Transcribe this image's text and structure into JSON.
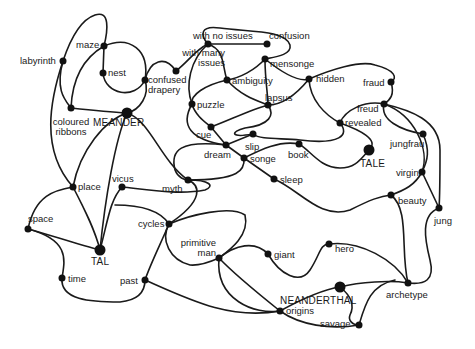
{
  "diagram": {
    "title": "",
    "nodes": [
      {
        "id": "labyrinth",
        "label": "labyrinth",
        "x": 63,
        "y": 61,
        "r": 3.5,
        "lx": 20,
        "ly": 56,
        "align": "left"
      },
      {
        "id": "maze",
        "label": "maze",
        "x": 104,
        "y": 46,
        "r": 3.5,
        "lx": 76,
        "ly": 40,
        "align": "left"
      },
      {
        "id": "nest",
        "label": "nest",
        "x": 103,
        "y": 73,
        "r": 3.5,
        "lx": 108,
        "ly": 68,
        "align": "left"
      },
      {
        "id": "confused_drapery",
        "label": "confused\ndrapery",
        "x": 145,
        "y": 80,
        "r": 3.5,
        "lx": 148,
        "ly": 75,
        "align": "left"
      },
      {
        "id": "with_many_issues",
        "label": "with many\nissues",
        "x": 176,
        "y": 71,
        "r": 3.5,
        "lx": 155,
        "ly": 48,
        "align": "right",
        "lw": 70
      },
      {
        "id": "with_no_issues",
        "label": "with no issues",
        "x": 208,
        "y": 44,
        "r": 3.5,
        "lx": 193,
        "ly": 31,
        "align": "left"
      },
      {
        "id": "confusion",
        "label": "confusion",
        "x": 267,
        "y": 44,
        "r": 3.5,
        "lx": 269,
        "ly": 31,
        "align": "left"
      },
      {
        "id": "mensonge",
        "label": "mensonge",
        "x": 265,
        "y": 59,
        "r": 3.5,
        "lx": 270,
        "ly": 59,
        "align": "left"
      },
      {
        "id": "ambiguity",
        "label": "ambiguity",
        "x": 227,
        "y": 80,
        "r": 3.5,
        "lx": 232,
        "ly": 76,
        "align": "left"
      },
      {
        "id": "hidden",
        "label": "hidden",
        "x": 309,
        "y": 79,
        "r": 3.5,
        "lx": 316,
        "ly": 74,
        "align": "left"
      },
      {
        "id": "fraud",
        "label": "fraud",
        "x": 391,
        "y": 82,
        "r": 3.5,
        "lx": 363,
        "ly": 78,
        "align": "left"
      },
      {
        "id": "puzzle",
        "label": "puzzle",
        "x": 192,
        "y": 104,
        "r": 3.5,
        "lx": 197,
        "ly": 100,
        "align": "left"
      },
      {
        "id": "lapsus",
        "label": "lapsus",
        "x": 268,
        "y": 105,
        "r": 3.5,
        "lx": 265,
        "ly": 93,
        "align": "left"
      },
      {
        "id": "freud",
        "label": "freud",
        "x": 384,
        "y": 104,
        "r": 3.5,
        "lx": 357,
        "ly": 104,
        "align": "left"
      },
      {
        "id": "revealed",
        "label": "revealed",
        "x": 340,
        "y": 123,
        "r": 3.5,
        "lx": 345,
        "ly": 118,
        "align": "left"
      },
      {
        "id": "meander",
        "label": "MEANDER",
        "x": 127,
        "y": 113,
        "r": 5.5,
        "lx": 93,
        "ly": 118,
        "align": "left",
        "major": true
      },
      {
        "id": "coloured_ribbons",
        "label": "coloured\nribbons",
        "x": 71,
        "y": 108,
        "r": 3.5,
        "lx": 46,
        "ly": 117,
        "align": "center",
        "lw": 50
      },
      {
        "id": "cue",
        "label": "cue",
        "x": 211,
        "y": 127,
        "r": 3.5,
        "lx": 196,
        "ly": 130,
        "align": "left"
      },
      {
        "id": "slip",
        "label": "slip",
        "x": 253,
        "y": 134,
        "r": 3.5,
        "lx": 245,
        "ly": 142,
        "align": "left"
      },
      {
        "id": "jungfrau",
        "label": "jungfrau",
        "x": 423,
        "y": 134,
        "r": 3.5,
        "lx": 390,
        "ly": 139,
        "align": "left"
      },
      {
        "id": "dream",
        "label": "dream",
        "x": 226,
        "y": 145,
        "r": 3.5,
        "lx": 204,
        "ly": 150,
        "align": "left"
      },
      {
        "id": "book",
        "label": "book",
        "x": 299,
        "y": 144,
        "r": 3.5,
        "lx": 288,
        "ly": 150,
        "align": "left"
      },
      {
        "id": "tale",
        "label": "TALE",
        "x": 369,
        "y": 150,
        "r": 5.5,
        "lx": 360,
        "ly": 159,
        "align": "left",
        "major": true
      },
      {
        "id": "songe",
        "label": "songe",
        "x": 244,
        "y": 158,
        "r": 3.5,
        "lx": 250,
        "ly": 154,
        "align": "left"
      },
      {
        "id": "virgin",
        "label": "virgin",
        "x": 422,
        "y": 172,
        "r": 3.5,
        "lx": 396,
        "ly": 168,
        "align": "left"
      },
      {
        "id": "sleep",
        "label": "sleep",
        "x": 274,
        "y": 179,
        "r": 3.5,
        "lx": 280,
        "ly": 175,
        "align": "left"
      },
      {
        "id": "myth",
        "label": "myth",
        "x": 188,
        "y": 180,
        "r": 3.5,
        "lx": 162,
        "ly": 184,
        "align": "left"
      },
      {
        "id": "vicus",
        "label": "vicus",
        "x": 122,
        "y": 187,
        "r": 3.5,
        "lx": 112,
        "ly": 174,
        "align": "left"
      },
      {
        "id": "place",
        "label": "place",
        "x": 73,
        "y": 187,
        "r": 3.5,
        "lx": 78,
        "ly": 182,
        "align": "left"
      },
      {
        "id": "beauty",
        "label": "beauty",
        "x": 391,
        "y": 195,
        "r": 3.5,
        "lx": 398,
        "ly": 196,
        "align": "left"
      },
      {
        "id": "jung",
        "label": "jung",
        "x": 439,
        "y": 208,
        "r": 3.5,
        "lx": 434,
        "ly": 216,
        "align": "left"
      },
      {
        "id": "space",
        "label": "space",
        "x": 28,
        "y": 229,
        "r": 3.5,
        "lx": 28,
        "ly": 214,
        "align": "left"
      },
      {
        "id": "cycles",
        "label": "cycles",
        "x": 169,
        "y": 224,
        "r": 3.5,
        "lx": 138,
        "ly": 219,
        "align": "left"
      },
      {
        "id": "tal",
        "label": "TAL",
        "x": 100,
        "y": 250,
        "r": 5.5,
        "lx": 91,
        "ly": 257,
        "align": "left",
        "major": true
      },
      {
        "id": "primitive_man",
        "label": "primitive\nman",
        "x": 219,
        "y": 258,
        "r": 3.5,
        "lx": 168,
        "ly": 238,
        "align": "right",
        "lw": 48
      },
      {
        "id": "giant",
        "label": "giant",
        "x": 268,
        "y": 254,
        "r": 3.5,
        "lx": 274,
        "ly": 250,
        "align": "left"
      },
      {
        "id": "hero",
        "label": "hero",
        "x": 329,
        "y": 244,
        "r": 3.5,
        "lx": 335,
        "ly": 244,
        "align": "left"
      },
      {
        "id": "time",
        "label": "time",
        "x": 62,
        "y": 278,
        "r": 3.5,
        "lx": 68,
        "ly": 274,
        "align": "left"
      },
      {
        "id": "past",
        "label": "past",
        "x": 145,
        "y": 280,
        "r": 3.5,
        "lx": 120,
        "ly": 276,
        "align": "left"
      },
      {
        "id": "neanderthal",
        "label": "NEANDERTHAL",
        "x": 340,
        "y": 287,
        "r": 5.5,
        "lx": 280,
        "ly": 296,
        "align": "left",
        "major": true
      },
      {
        "id": "archetype",
        "label": "archetype",
        "x": 408,
        "y": 283,
        "r": 3.5,
        "lx": 386,
        "ly": 290,
        "align": "left"
      },
      {
        "id": "origins",
        "label": "origins",
        "x": 280,
        "y": 311,
        "r": 3.5,
        "lx": 286,
        "ly": 306,
        "align": "left"
      },
      {
        "id": "savage",
        "label": "savage",
        "x": 359,
        "y": 325,
        "r": 3.5,
        "lx": 320,
        "ly": 319,
        "align": "left"
      }
    ],
    "edges": [
      {
        "d": "M63,61 C70,40 80,20 95,15 C110,10 108,30 104,46"
      },
      {
        "d": "M63,61 C55,90 65,100 71,108"
      },
      {
        "d": "M63,61 C50,100 40,150 73,187"
      },
      {
        "d": "M104,46 L103,73"
      },
      {
        "d": "M104,46 C130,35 150,50 145,80"
      },
      {
        "d": "M104,46 C80,60 72,85 71,108"
      },
      {
        "d": "M103,73 C105,95 135,100 145,80"
      },
      {
        "d": "M145,80 C150,60 165,55 176,71"
      },
      {
        "d": "M145,80 C150,95 140,110 127,113"
      },
      {
        "d": "M176,71 C190,60 195,50 208,44"
      },
      {
        "d": "M208,44 C200,35 200,25 220,28 C250,32 285,30 290,45 C292,55 275,57 265,59"
      },
      {
        "d": "M208,44 L267,44"
      },
      {
        "d": "M208,44 C225,50 222,65 227,80"
      },
      {
        "d": "M208,44 C190,60 185,85 192,104"
      },
      {
        "d": "M265,59 C255,70 240,78 227,80"
      },
      {
        "d": "M265,59 C285,75 300,82 309,79"
      },
      {
        "d": "M265,59 C265,80 268,95 268,105"
      },
      {
        "d": "M227,80 C205,85 190,95 192,104"
      },
      {
        "d": "M227,80 C240,95 255,100 268,105"
      },
      {
        "d": "M192,104 C195,115 205,122 211,127"
      },
      {
        "d": "M192,104 C180,125 190,140 226,145"
      },
      {
        "d": "M211,127 C230,120 250,110 268,105"
      },
      {
        "d": "M211,127 L226,145"
      },
      {
        "d": "M268,105 C275,115 270,125 245,128 C230,132 230,138 253,134"
      },
      {
        "d": "M268,105 C285,105 300,90 309,79"
      },
      {
        "d": "M309,79 C330,70 360,60 375,65 C395,70 398,78 391,82"
      },
      {
        "d": "M309,79 C310,100 325,115 340,123"
      },
      {
        "d": "M391,82 C395,95 390,100 384,104"
      },
      {
        "d": "M384,104 C365,100 345,110 340,123"
      },
      {
        "d": "M384,104 C380,120 400,130 423,134"
      },
      {
        "d": "M384,104 C410,110 440,120 440,150 C440,180 440,195 439,208"
      },
      {
        "d": "M340,123 C350,135 340,145 300,140 C280,138 260,140 253,134"
      },
      {
        "d": "M340,123 C360,130 380,140 369,150"
      },
      {
        "d": "M369,150 C360,160 355,168 340,168 C320,168 310,150 299,144"
      },
      {
        "d": "M299,144 C280,140 260,150 244,158"
      },
      {
        "d": "M226,145 L244,158"
      },
      {
        "d": "M226,145 L253,134"
      },
      {
        "d": "M244,158 L274,179"
      },
      {
        "d": "M274,179 C300,190 320,220 350,210 C370,200 380,196 391,195"
      },
      {
        "d": "M244,158 C245,170 240,180 188,180"
      },
      {
        "d": "M226,145 C180,140 170,150 175,170 C178,178 185,180 188,180"
      },
      {
        "d": "M127,113 C150,120 160,160 188,180"
      },
      {
        "d": "M127,113 C105,120 80,150 73,187"
      },
      {
        "d": "M127,113 C115,140 105,200 100,250"
      },
      {
        "d": "M71,108 C90,110 110,112 127,113"
      },
      {
        "d": "M73,187 C85,210 95,230 100,250"
      },
      {
        "d": "M73,187 C55,190 35,195 28,229"
      },
      {
        "d": "M122,187 C150,190 180,195 205,190 C215,186 210,180 188,180"
      },
      {
        "d": "M122,187 C110,200 108,220 100,250"
      },
      {
        "d": "M115,205 C140,205 160,210 169,224"
      },
      {
        "d": "M188,180 C200,185 205,200 169,224"
      },
      {
        "d": "M28,229 C50,235 80,245 100,250"
      },
      {
        "d": "M28,229 C70,240 65,260 62,278"
      },
      {
        "d": "M62,278 C60,300 90,302 120,302 C140,300 145,290 145,280"
      },
      {
        "d": "M169,224 C160,245 150,265 145,280"
      },
      {
        "d": "M169,224 C190,215 230,205 245,215 C250,235 230,250 219,258"
      },
      {
        "d": "M169,224 C160,240 170,260 190,265 C200,266 210,262 219,258"
      },
      {
        "d": "M219,258 C235,245 255,240 268,254"
      },
      {
        "d": "M268,254 C280,275 300,285 310,270 C320,255 320,244 329,244"
      },
      {
        "d": "M329,244 C360,240 395,260 408,283"
      },
      {
        "d": "M219,258 C235,275 260,295 280,311"
      },
      {
        "d": "M219,258 C215,300 255,315 280,311"
      },
      {
        "d": "M145,280 C190,300 230,320 280,311"
      },
      {
        "d": "M280,311 C300,300 320,290 340,287"
      },
      {
        "d": "M280,311 C300,325 330,330 359,325"
      },
      {
        "d": "M340,287 C350,295 355,305 350,315 C348,320 352,325 359,325"
      },
      {
        "d": "M340,287 C360,282 390,280 408,283"
      },
      {
        "d": "M359,325 C365,305 370,285 395,280"
      },
      {
        "d": "M391,195 C410,210 400,250 408,283"
      },
      {
        "d": "M391,195 C405,190 415,185 422,172"
      },
      {
        "d": "M423,134 C430,150 428,160 422,172"
      },
      {
        "d": "M384,104 C415,115 430,150 422,172"
      },
      {
        "d": "M422,172 L439,208"
      },
      {
        "d": "M439,208 C420,215 425,240 430,260 C435,280 425,285 408,283"
      }
    ]
  }
}
